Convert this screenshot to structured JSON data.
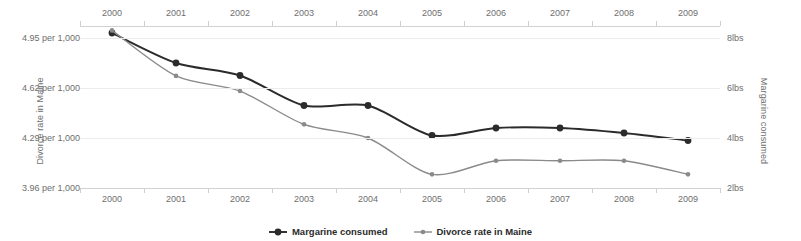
{
  "chart_data": {
    "type": "line",
    "title": "",
    "subtitle": "",
    "xlabel": "",
    "grid": true,
    "legend_position": "bottom",
    "categories": [
      "2000",
      "2001",
      "2002",
      "2003",
      "2004",
      "2005",
      "2006",
      "2007",
      "2008",
      "2009"
    ],
    "x_tick_labels_top": [
      "2000",
      "2001",
      "2002",
      "2003",
      "2004",
      "2005",
      "2006",
      "2007",
      "2008",
      "2009"
    ],
    "x_tick_labels_bottom": [
      "2000",
      "2001",
      "2002",
      "2003",
      "2004",
      "2005",
      "2006",
      "2007",
      "2008",
      "2009"
    ],
    "axes": {
      "left": {
        "label": "Divorce rate in Maine",
        "tick_labels": [
          "4.95 per 1,000",
          "4.62 per 1,000",
          "4.29 per 1,000",
          "3.96 per 1,000"
        ],
        "tick_values": [
          4.95,
          4.62,
          4.29,
          3.96
        ],
        "ylim": [
          3.96,
          5.07
        ],
        "units": "per 1,000"
      },
      "right": {
        "label": "Margarine consumed",
        "tick_labels": [
          "8lbs",
          "6lbs",
          "4lbs",
          "2lbs"
        ],
        "tick_values": [
          8,
          6,
          4,
          2
        ],
        "ylim": [
          2,
          8.7
        ],
        "units": "lbs"
      }
    },
    "series": [
      {
        "name": "Margarine consumed",
        "axis": "right",
        "color": "#2b2b2b",
        "marker": "circle",
        "units": "lbs",
        "x": [
          "2000",
          "2001",
          "2002",
          "2003",
          "2004",
          "2005",
          "2006",
          "2007",
          "2008",
          "2009"
        ],
        "values": [
          8.2,
          7.0,
          6.5,
          5.3,
          5.3,
          4.1,
          4.4,
          4.4,
          4.2,
          3.9
        ]
      },
      {
        "name": "Divorce rate in Maine",
        "axis": "left",
        "color": "#8a8a8a",
        "marker": "small-circle",
        "units": "per 1,000",
        "x": [
          "2000",
          "2001",
          "2002",
          "2003",
          "2004",
          "2005",
          "2006",
          "2007",
          "2008",
          "2009"
        ],
        "values": [
          5.0,
          4.7,
          4.6,
          4.38,
          4.29,
          4.05,
          4.14,
          4.14,
          4.14,
          4.05
        ]
      }
    ]
  },
  "legend": {
    "items": [
      {
        "label": "Margarine consumed",
        "color": "#2b2b2b",
        "marker": "circle"
      },
      {
        "label": "Divorce rate in Maine",
        "color": "#8a8a8a",
        "marker": "small-circle"
      }
    ]
  }
}
